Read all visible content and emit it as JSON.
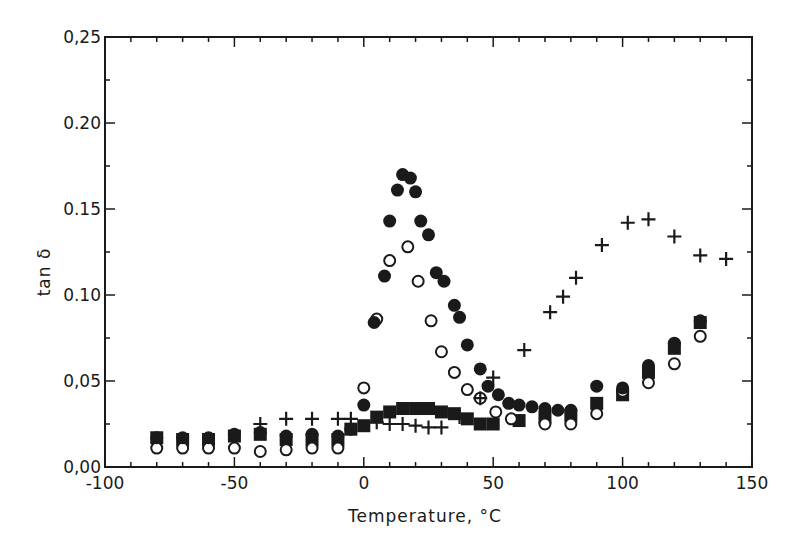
{
  "chart_data": {
    "type": "scatter",
    "title": "",
    "xlabel": "Temperature, °C",
    "ylabel": "tan δ",
    "xlim": [
      -100,
      150
    ],
    "ylim": [
      0,
      0.25
    ],
    "xticks": [
      -100,
      -50,
      0,
      50,
      100,
      150
    ],
    "xtick_labels": [
      "-100",
      "-50",
      "0",
      "50",
      "100",
      "150"
    ],
    "yticks": [
      0.0,
      0.05,
      0.1,
      0.15,
      0.2,
      0.25
    ],
    "ytick_labels": [
      "0,00",
      "0,05",
      "0.10",
      "0.15",
      "0.20",
      "0,25"
    ],
    "x_minor_step": 10,
    "y_minor_step": 0.025,
    "grid": false,
    "legend": null,
    "series": [
      {
        "name": "filled circles",
        "marker": "filled-circle",
        "points": [
          [
            -80,
            0.017
          ],
          [
            -70,
            0.017
          ],
          [
            -60,
            0.017
          ],
          [
            -50,
            0.019
          ],
          [
            -40,
            0.02
          ],
          [
            -30,
            0.018
          ],
          [
            -20,
            0.019
          ],
          [
            -10,
            0.018
          ],
          [
            -5,
            0.022
          ],
          [
            0,
            0.036
          ],
          [
            4,
            0.084
          ],
          [
            8,
            0.111
          ],
          [
            10,
            0.143
          ],
          [
            13,
            0.161
          ],
          [
            15,
            0.17
          ],
          [
            18,
            0.168
          ],
          [
            20,
            0.16
          ],
          [
            22,
            0.143
          ],
          [
            25,
            0.135
          ],
          [
            28,
            0.113
          ],
          [
            31,
            0.108
          ],
          [
            35,
            0.094
          ],
          [
            37,
            0.087
          ],
          [
            40,
            0.071
          ],
          [
            45,
            0.057
          ],
          [
            48,
            0.047
          ],
          [
            52,
            0.042
          ],
          [
            56,
            0.037
          ],
          [
            60,
            0.036
          ],
          [
            65,
            0.035
          ],
          [
            70,
            0.034
          ],
          [
            75,
            0.033
          ],
          [
            80,
            0.033
          ],
          [
            90,
            0.047
          ],
          [
            100,
            0.046
          ],
          [
            110,
            0.059
          ],
          [
            120,
            0.072
          ],
          [
            130,
            0.085
          ]
        ]
      },
      {
        "name": "open circles",
        "marker": "open-circle",
        "points": [
          [
            -80,
            0.011
          ],
          [
            -70,
            0.011
          ],
          [
            -60,
            0.011
          ],
          [
            -50,
            0.011
          ],
          [
            -40,
            0.009
          ],
          [
            -30,
            0.01
          ],
          [
            -20,
            0.011
          ],
          [
            -10,
            0.011
          ],
          [
            0,
            0.046
          ],
          [
            5,
            0.086
          ],
          [
            10,
            0.12
          ],
          [
            17,
            0.128
          ],
          [
            21,
            0.108
          ],
          [
            26,
            0.085
          ],
          [
            30,
            0.067
          ],
          [
            35,
            0.055
          ],
          [
            40,
            0.045
          ],
          [
            45,
            0.04
          ],
          [
            51,
            0.032
          ],
          [
            57,
            0.028
          ],
          [
            70,
            0.025
          ],
          [
            80,
            0.025
          ],
          [
            90,
            0.031
          ],
          [
            100,
            0.044
          ],
          [
            110,
            0.049
          ],
          [
            120,
            0.06
          ],
          [
            130,
            0.076
          ]
        ]
      },
      {
        "name": "filled squares",
        "marker": "filled-square",
        "points": [
          [
            -80,
            0.017
          ],
          [
            -70,
            0.016
          ],
          [
            -60,
            0.016
          ],
          [
            -50,
            0.018
          ],
          [
            -40,
            0.019
          ],
          [
            -30,
            0.016
          ],
          [
            -20,
            0.016
          ],
          [
            -10,
            0.016
          ],
          [
            -5,
            0.022
          ],
          [
            0,
            0.024
          ],
          [
            5,
            0.029
          ],
          [
            10,
            0.032
          ],
          [
            15,
            0.034
          ],
          [
            20,
            0.034
          ],
          [
            25,
            0.034
          ],
          [
            30,
            0.032
          ],
          [
            35,
            0.031
          ],
          [
            40,
            0.028
          ],
          [
            45,
            0.025
          ],
          [
            50,
            0.025
          ],
          [
            60,
            0.027
          ],
          [
            70,
            0.029
          ],
          [
            80,
            0.03
          ],
          [
            90,
            0.037
          ],
          [
            100,
            0.042
          ],
          [
            110,
            0.055
          ],
          [
            120,
            0.069
          ],
          [
            130,
            0.084
          ]
        ]
      },
      {
        "name": "crosses",
        "marker": "plus",
        "points": [
          [
            -40,
            0.025
          ],
          [
            -30,
            0.028
          ],
          [
            -20,
            0.028
          ],
          [
            -10,
            0.028
          ],
          [
            -5,
            0.028
          ],
          [
            5,
            0.026
          ],
          [
            10,
            0.025
          ],
          [
            15,
            0.025
          ],
          [
            20,
            0.024
          ],
          [
            25,
            0.023
          ],
          [
            30,
            0.023
          ],
          [
            37,
            0.029
          ],
          [
            45,
            0.04
          ],
          [
            50,
            0.052
          ],
          [
            62,
            0.068
          ],
          [
            72,
            0.09
          ],
          [
            77,
            0.099
          ],
          [
            82,
            0.11
          ],
          [
            92,
            0.129
          ],
          [
            102,
            0.142
          ],
          [
            110,
            0.144
          ],
          [
            120,
            0.134
          ],
          [
            130,
            0.123
          ],
          [
            140,
            0.121
          ]
        ]
      }
    ]
  }
}
